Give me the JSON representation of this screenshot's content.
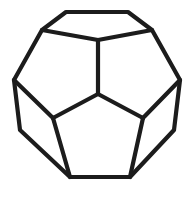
{
  "figure": {
    "name": "dodecahedron",
    "background_color": "#ffffff",
    "line_color": "#1c1c1c",
    "line_width": 4.2,
    "canvas": {
      "width": 195,
      "height": 198
    },
    "visible_faces": 5,
    "total_faces": 12
  },
  "chart_data": {
    "type": "diagram",
    "vertices": {
      "top_left": [
        66,
        12
      ],
      "top_right": [
        128,
        12
      ],
      "shoulder_left": [
        42,
        30
      ],
      "shoulder_right": [
        152,
        30
      ],
      "side_upper_left": [
        14,
        80
      ],
      "side_upper_right": [
        180,
        80
      ],
      "side_lower_left": [
        20,
        130
      ],
      "side_lower_right": [
        174,
        130
      ],
      "bottom_left": [
        70,
        177
      ],
      "bottom_right": [
        130,
        177
      ],
      "center_hub": [
        98,
        94
      ],
      "top_pentagon_apex": [
        98,
        40
      ],
      "inner_left": [
        53,
        118
      ],
      "inner_right": [
        143,
        118
      ]
    },
    "outline_path": "M 66 12 L 128 12 L 152 30 L 180 80 L 174 130 L 130 177 L 70 177 L 20 130 L 14 80 L 42 30 Z",
    "interior_edges": [
      {
        "name": "hub-to-apex",
        "from": [
          98,
          94
        ],
        "to": [
          98,
          40
        ]
      },
      {
        "name": "apex-to-shoulder-left",
        "from": [
          98,
          40
        ],
        "to": [
          42,
          30
        ]
      },
      {
        "name": "apex-to-shoulder-right",
        "from": [
          98,
          40
        ],
        "to": [
          152,
          30
        ]
      },
      {
        "name": "hub-to-inner-left",
        "from": [
          98,
          94
        ],
        "to": [
          53,
          118
        ]
      },
      {
        "name": "hub-to-inner-right",
        "from": [
          98,
          94
        ],
        "to": [
          143,
          118
        ]
      },
      {
        "name": "inner-left-to-side-upper-left",
        "from": [
          53,
          118
        ],
        "to": [
          14,
          80
        ]
      },
      {
        "name": "inner-right-to-side-upper-right",
        "from": [
          143,
          118
        ],
        "to": [
          180,
          80
        ]
      },
      {
        "name": "inner-left-to-bottom-left",
        "from": [
          53,
          118
        ],
        "to": [
          70,
          177
        ]
      },
      {
        "name": "inner-right-to-bottom-right",
        "from": [
          143,
          118
        ],
        "to": [
          130,
          177
        ]
      }
    ],
    "faces": [
      {
        "name": "top-pentagon",
        "points": "66,12 128,12 152,30 98,40 42,30"
      },
      {
        "name": "upper-left-pentagon",
        "points": "42,30 98,40 98,94 53,118 14,80"
      },
      {
        "name": "upper-right-pentagon",
        "points": "98,40 152,30 180,80 143,118 98,94"
      },
      {
        "name": "lower-left-pentagon",
        "points": "14,80 53,118 70,177 20,130"
      },
      {
        "name": "bottom-pentagon",
        "points": "53,118 98,94 143,118 130,177 70,177"
      },
      {
        "name": "lower-right-pentagon",
        "points": "143,118 180,80 174,130 130,177"
      }
    ],
    "grid": false,
    "legend": null,
    "xlabel": "",
    "ylabel": ""
  }
}
